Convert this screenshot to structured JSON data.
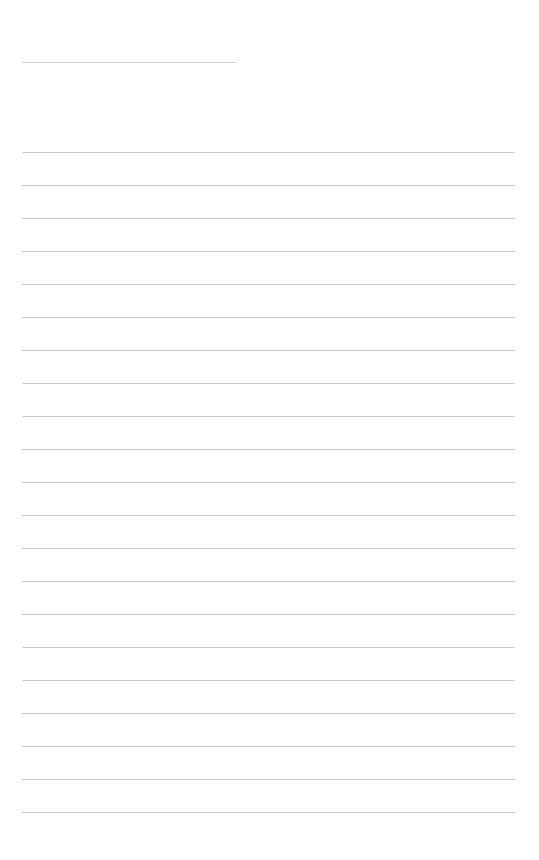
{
  "page": {
    "type": "lined-paper",
    "background": "#ffffff",
    "line_color": "#c9c9c9",
    "header_line": {
      "x": 22,
      "y": 62,
      "width": 214
    },
    "ruled_lines": {
      "count": 21,
      "start_y": 152,
      "spacing": 33,
      "x": 22,
      "width": 493
    }
  }
}
